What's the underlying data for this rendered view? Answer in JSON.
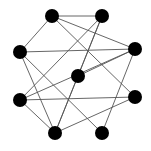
{
  "graph": {
    "node_color": "#000000",
    "edge_color": "#555555",
    "node_radius": 7,
    "nodes": [
      {
        "id": "A",
        "x": 52,
        "y": 16
      },
      {
        "id": "B",
        "x": 102,
        "y": 16
      },
      {
        "id": "C",
        "x": 20,
        "y": 52
      },
      {
        "id": "D",
        "x": 135,
        "y": 49
      },
      {
        "id": "E",
        "x": 78,
        "y": 76
      },
      {
        "id": "F",
        "x": 20,
        "y": 100
      },
      {
        "id": "G",
        "x": 135,
        "y": 97
      },
      {
        "id": "H",
        "x": 55,
        "y": 133
      },
      {
        "id": "I",
        "x": 102,
        "y": 133
      }
    ],
    "edges": [
      [
        "A",
        "B"
      ],
      [
        "A",
        "C"
      ],
      [
        "A",
        "D"
      ],
      [
        "A",
        "G"
      ],
      [
        "B",
        "E"
      ],
      [
        "B",
        "F"
      ],
      [
        "B",
        "H"
      ],
      [
        "C",
        "D"
      ],
      [
        "C",
        "H"
      ],
      [
        "C",
        "I"
      ],
      [
        "D",
        "E"
      ],
      [
        "D",
        "F"
      ],
      [
        "D",
        "I"
      ],
      [
        "E",
        "H"
      ],
      [
        "F",
        "G"
      ],
      [
        "F",
        "H"
      ],
      [
        "G",
        "H"
      ]
    ]
  }
}
